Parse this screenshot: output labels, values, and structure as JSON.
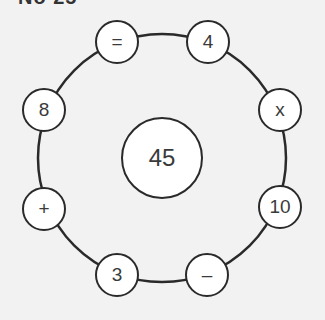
{
  "title": "No 25",
  "colors": {
    "background": "#f2f2f2",
    "stroke": "#2a2a2a",
    "text": "#3a3a3a",
    "fill": "#ffffff"
  },
  "center": {
    "value": "45"
  },
  "ring_nodes": [
    {
      "position": "top-left",
      "value": "="
    },
    {
      "position": "top-right",
      "value": "4"
    },
    {
      "position": "right-upper",
      "value": "x"
    },
    {
      "position": "right-lower",
      "value": "10"
    },
    {
      "position": "bottom-right",
      "value": "–"
    },
    {
      "position": "bottom-left",
      "value": "3"
    },
    {
      "position": "left-lower",
      "value": "+"
    },
    {
      "position": "left-upper",
      "value": "8"
    }
  ]
}
